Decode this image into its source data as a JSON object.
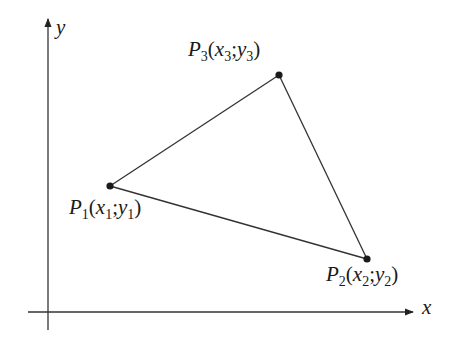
{
  "diagram": {
    "type": "coordinate-triangle",
    "stroke_color": "#333333",
    "point_color": "#1a1a1a",
    "axes": {
      "origin": {
        "x": 48,
        "y": 312
      },
      "x_axis": {
        "label": "x",
        "from": [
          28,
          312
        ],
        "to": [
          413,
          312
        ]
      },
      "y_axis": {
        "label": "y",
        "from": [
          48,
          330
        ],
        "to": [
          48,
          19
        ]
      }
    },
    "points": [
      {
        "id": "P1",
        "name": "P",
        "index": "1",
        "x_var": "x",
        "y_var": "y",
        "label": "P1(x1;y1)",
        "px": 110,
        "py": 186
      },
      {
        "id": "P2",
        "name": "P",
        "index": "2",
        "x_var": "x",
        "y_var": "y",
        "label": "P2(x2;y2)",
        "px": 367,
        "py": 259
      },
      {
        "id": "P3",
        "name": "P",
        "index": "3",
        "x_var": "x",
        "y_var": "y",
        "label": "P3(x3;y3)",
        "px": 279,
        "py": 75
      }
    ],
    "edges": [
      [
        "P1",
        "P3"
      ],
      [
        "P3",
        "P2"
      ],
      [
        "P2",
        "P1"
      ]
    ]
  },
  "labels": {
    "y_axis": "y",
    "x_axis": "x",
    "p1": {
      "P": "P",
      "i": "1",
      "open": "(",
      "x": "x",
      "sep": ";",
      "y": "y",
      "close": ")"
    },
    "p2": {
      "P": "P",
      "i": "2",
      "open": "(",
      "x": "x",
      "sep": ";",
      "y": "y",
      "close": ")"
    },
    "p3": {
      "P": "P",
      "i": "3",
      "open": "(",
      "x": "x",
      "sep": ";",
      "y": "y",
      "close": ")"
    }
  }
}
